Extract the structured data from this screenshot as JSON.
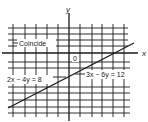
{
  "diagram": {
    "axes": {
      "x_label": "x",
      "y_label": "y",
      "origin_label": "0"
    },
    "annotations": {
      "coincide": "Coincide",
      "eq1": "2x − 4y = 8",
      "eq2": "3x − 6y = 12"
    },
    "colors": {
      "ink": "#1a1a1a",
      "background": "#ffffff"
    },
    "grid": {
      "vertical_x": [
        13,
        25,
        36,
        47,
        58,
        80,
        92,
        102,
        113,
        124
      ],
      "horizontal_y": [
        28,
        34,
        40,
        46,
        62,
        68,
        87,
        93,
        100,
        107,
        113
      ]
    },
    "line": {
      "description": "Coincident lines 2x − 4y = 8 and 3x − 6y = 12",
      "from": [
        8,
        108
      ],
      "to": [
        134,
        43
      ]
    }
  }
}
